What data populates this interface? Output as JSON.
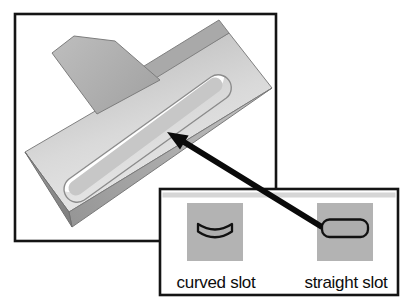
{
  "figure": {
    "kind": "cad-feature-callout-diagram",
    "main_view": "3d-part-with-straight-slot"
  },
  "palette": {
    "options": [
      {
        "id": "curved-slot",
        "label": "curved slot"
      },
      {
        "id": "straight-slot",
        "label": "straight slot"
      }
    ]
  },
  "callout": {
    "from": "straight-slot-icon",
    "to": "slot-on-part"
  },
  "colors": {
    "border": "#141414",
    "panel_band": "#d6d6d6",
    "tile": "#b3b3b3",
    "glyph_fill": "#adadad",
    "glyph_outline": "#111111",
    "arrow": "#0a0a0a",
    "part_face_light": "#eeeeee",
    "part_face_dark": "#bfbfbf",
    "gusset": "#b0b0b0",
    "edge_face": "#9c9c9c",
    "slot_shadow": "#c7c7c7",
    "text": "#0d0d0d"
  }
}
